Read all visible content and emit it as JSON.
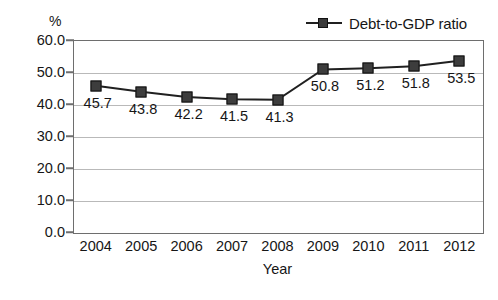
{
  "chart_data": {
    "type": "line",
    "title": "",
    "xlabel": "Year",
    "ylabel": "%",
    "categories": [
      "2004",
      "2005",
      "2006",
      "2007",
      "2008",
      "2009",
      "2010",
      "2011",
      "2012"
    ],
    "series": [
      {
        "name": "Debt-to-GDP ratio",
        "values": [
          45.7,
          43.8,
          42.2,
          41.5,
          41.3,
          50.8,
          51.2,
          51.8,
          53.5
        ],
        "marker": "square",
        "color": "#3d3d3d",
        "line_color": "#202020"
      }
    ],
    "data_labels": [
      "45.7",
      "43.8",
      "42.2",
      "41.5",
      "41.3",
      "50.8",
      "51.2",
      "51.8",
      "53.5"
    ],
    "ylim": [
      0.0,
      60.0
    ],
    "yticks": [
      "0.0",
      "10.0",
      "20.0",
      "30.0",
      "40.0",
      "50.0",
      "60.0"
    ],
    "ytick_values": [
      0.0,
      10.0,
      20.0,
      30.0,
      40.0,
      50.0,
      60.0
    ],
    "grid": "horizontal",
    "legend_position": "top-right",
    "legend": [
      "Debt-to-GDP ratio"
    ]
  },
  "axis": {
    "y_unit": "%",
    "x_title": "Year"
  },
  "legend": {
    "entry_label": "Debt-to-GDP ratio"
  },
  "colors": {
    "marker_fill": "#3d3d3d",
    "marker_edge": "#0f0f0f",
    "line": "#202020",
    "grid": "#b9b9b9",
    "frame": "#6e6e6e",
    "text": "#161616",
    "background": "#ffffff"
  }
}
